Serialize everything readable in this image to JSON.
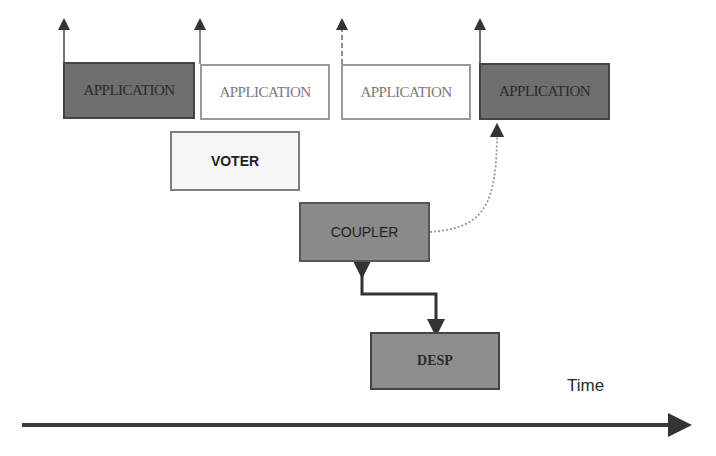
{
  "diagram": {
    "applications": [
      {
        "label": "APPLICATION",
        "style": "dark"
      },
      {
        "label": "APPLICATION",
        "style": "light"
      },
      {
        "label": "APPLICATION",
        "style": "light"
      },
      {
        "label": "APPLICATION",
        "style": "dark"
      }
    ],
    "voter": {
      "label": "VOTER"
    },
    "coupler": {
      "label": "COUPLER"
    },
    "desp": {
      "label": "DESP"
    },
    "time_axis": {
      "label": "Time"
    },
    "colors": {
      "dark_box": "#6f6f6f",
      "light_box": "#ffffff",
      "voter_box": "#f6f6f6",
      "coupler_box": "#8a8a8a",
      "desp_box": "#8e8e8e",
      "arrow": "#333333"
    }
  }
}
